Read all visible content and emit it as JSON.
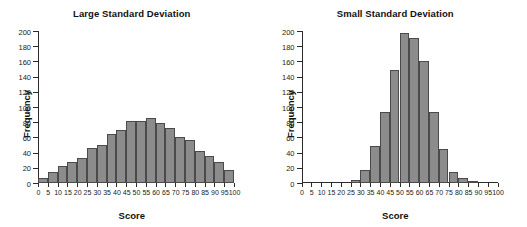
{
  "figure": {
    "panel_count": 2,
    "bar_fill_color": "#8c8c8c",
    "bar_border_color": "#4a4a4a",
    "axis_color": "#2b2b2b",
    "background_color": "#ffffff"
  },
  "chart_data": [
    {
      "type": "bar",
      "title": "Large Standard Deviation",
      "xlabel": "Score",
      "ylabel": "Frequency",
      "grid": false,
      "legend": "none",
      "xlim": [
        0,
        100
      ],
      "ylim": [
        0,
        200
      ],
      "ytick_labels": [
        "0",
        "20",
        "40",
        "60",
        "80",
        "100",
        "120",
        "140",
        "160",
        "180",
        "200"
      ],
      "yticks": [
        0,
        20,
        40,
        60,
        80,
        100,
        120,
        140,
        160,
        180,
        200
      ],
      "xtick_labels": [
        "0",
        "5",
        "10",
        "15",
        "20",
        "25",
        "30",
        "35",
        "40",
        "45",
        "50",
        "55",
        "60",
        "65",
        "70",
        "75",
        "80",
        "85",
        "90",
        "95",
        "100"
      ],
      "xticks": [
        0,
        5,
        10,
        15,
        20,
        25,
        30,
        35,
        40,
        45,
        50,
        55,
        60,
        65,
        70,
        75,
        80,
        85,
        90,
        95,
        100
      ],
      "bin_width": 5,
      "categories": [
        "0-5",
        "5-10",
        "10-15",
        "15-20",
        "20-25",
        "25-30",
        "30-35",
        "35-40",
        "40-45",
        "45-50",
        "50-55",
        "55-60",
        "60-65",
        "65-70",
        "70-75",
        "75-80",
        "80-85",
        "85-90",
        "90-95",
        "95-100"
      ],
      "bin_starts": [
        0,
        5,
        10,
        15,
        20,
        25,
        30,
        35,
        40,
        45,
        50,
        55,
        60,
        65,
        70,
        75,
        80,
        85,
        90,
        95
      ],
      "values": [
        6,
        14,
        22,
        27,
        33,
        46,
        50,
        65,
        70,
        81,
        82,
        85,
        79,
        72,
        61,
        57,
        42,
        35,
        27,
        17
      ]
    },
    {
      "type": "bar",
      "title": "Small Standard Deviation",
      "xlabel": "Score",
      "ylabel": "Frequency",
      "grid": false,
      "legend": "none",
      "xlim": [
        0,
        100
      ],
      "ylim": [
        0,
        200
      ],
      "ytick_labels": [
        "0",
        "20",
        "40",
        "60",
        "80",
        "100",
        "120",
        "140",
        "160",
        "180",
        "200"
      ],
      "yticks": [
        0,
        20,
        40,
        60,
        80,
        100,
        120,
        140,
        160,
        180,
        200
      ],
      "xtick_labels": [
        "0",
        "5",
        "10",
        "15",
        "20",
        "25",
        "30",
        "35",
        "40",
        "45",
        "50",
        "55",
        "60",
        "65",
        "70",
        "75",
        "80",
        "85",
        "90",
        "95",
        "100"
      ],
      "xticks": [
        0,
        5,
        10,
        15,
        20,
        25,
        30,
        35,
        40,
        45,
        50,
        55,
        60,
        65,
        70,
        75,
        80,
        85,
        90,
        95,
        100
      ],
      "bin_width": 5,
      "categories": [
        "0-5",
        "5-10",
        "10-15",
        "15-20",
        "20-25",
        "25-30",
        "30-35",
        "35-40",
        "40-45",
        "45-50",
        "50-55",
        "55-60",
        "60-65",
        "65-70",
        "70-75",
        "75-80",
        "80-85",
        "85-90",
        "90-95",
        "95-100"
      ],
      "bin_starts": [
        0,
        5,
        10,
        15,
        20,
        25,
        30,
        35,
        40,
        45,
        50,
        55,
        60,
        65,
        70,
        75,
        80,
        85,
        90,
        95
      ],
      "values": [
        0,
        0,
        0,
        0,
        0,
        4,
        17,
        49,
        94,
        149,
        197,
        191,
        160,
        93,
        45,
        15,
        7,
        3,
        0,
        0
      ]
    }
  ]
}
